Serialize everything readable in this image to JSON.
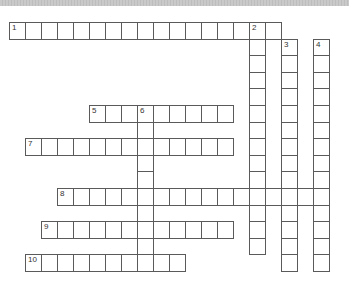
{
  "puzzle": {
    "cell_width": 16,
    "cell_height": 16.6,
    "origin_x": 9,
    "origin_y": 22,
    "grid_line_color": "#5a5a5a",
    "cell_fill": "#ffffff",
    "header_strip_color": "#c9c9c9",
    "words": [
      {
        "number": "1",
        "direction": "across",
        "row": 0,
        "col": 0,
        "length": 17
      },
      {
        "number": "2",
        "direction": "down",
        "row": 0,
        "col": 15,
        "length": 14
      },
      {
        "number": "3",
        "direction": "down",
        "row": 1,
        "col": 17,
        "length": 14
      },
      {
        "number": "4",
        "direction": "down",
        "row": 1,
        "col": 19,
        "length": 14
      },
      {
        "number": "5",
        "direction": "across",
        "row": 5,
        "col": 5,
        "length": 9
      },
      {
        "number": "6",
        "direction": "down",
        "row": 5,
        "col": 8,
        "length": 10
      },
      {
        "number": "7",
        "direction": "across",
        "row": 7,
        "col": 1,
        "length": 13
      },
      {
        "number": "8",
        "direction": "across",
        "row": 10,
        "col": 3,
        "length": 17
      },
      {
        "number": "9",
        "direction": "across",
        "row": 12,
        "col": 2,
        "length": 12
      },
      {
        "number": "10",
        "direction": "across",
        "row": 14,
        "col": 1,
        "length": 10
      }
    ]
  }
}
